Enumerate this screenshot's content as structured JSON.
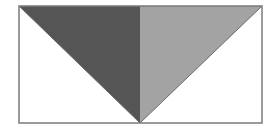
{
  "diagram": {
    "width": 278,
    "height": 131,
    "background": "#ffffff",
    "frame": {
      "x": 19,
      "y": 6,
      "width": 243,
      "height": 117,
      "stroke": "#7a7a7a",
      "stroke_width": 1.5
    },
    "apex": {
      "x": 140,
      "y": 123
    },
    "shapes": [
      {
        "name": "left-dark-triangle",
        "points": "19,6 140,6 140,123",
        "fill": "#555555"
      },
      {
        "name": "right-light-triangle",
        "points": "140,6 262,6 140,123",
        "fill": "#a3a3a3"
      }
    ],
    "lines": [
      {
        "name": "left-diagonal",
        "x1": 19,
        "y1": 6,
        "x2": 140,
        "y2": 123,
        "stroke": "#6a6a6a"
      },
      {
        "name": "right-diagonal",
        "x1": 262,
        "y1": 6,
        "x2": 140,
        "y2": 123,
        "stroke": "#6a6a6a"
      }
    ]
  }
}
